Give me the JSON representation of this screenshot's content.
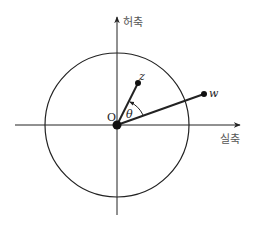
{
  "diagram": {
    "axes": {
      "imaginary_label": "허축",
      "real_label": "실축"
    },
    "origin_label": "O",
    "angle_label": "θ",
    "points": [
      {
        "id": "z",
        "label": "z"
      },
      {
        "id": "w",
        "label": "w"
      }
    ],
    "colors": {
      "stroke": "#222222",
      "label": "#555555"
    }
  }
}
